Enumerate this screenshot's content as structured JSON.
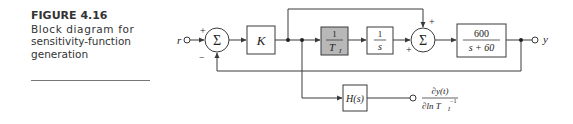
{
  "figure": {
    "number": "FIGURE 4.16",
    "caption_lines": [
      "Block diagram for",
      "sensitivity-function",
      "generation"
    ]
  },
  "diagram": {
    "input_label": "r",
    "output_label": "y",
    "sum1": {
      "symbol": "Σ",
      "sign_top": "+",
      "sign_bottom": "−"
    },
    "sum2": {
      "symbol": "Σ",
      "sign_top": "+",
      "sign_left": "+"
    },
    "blocks": {
      "gain": "K",
      "inv_ti": {
        "num": "1",
        "den": "T",
        "den_sub": "I"
      },
      "integrator": {
        "num": "1",
        "den": "s"
      },
      "plant": {
        "num": "600",
        "den": "s + 60"
      },
      "sensitivity_filter": "H(s)"
    },
    "sensitivity_output": {
      "num": "∂y(t)",
      "den_prefix": "∂ln T",
      "den_sub": "I",
      "den_sup": "−1"
    },
    "colors": {
      "line": "#3a3a3a",
      "highlight_block": "#b8b8b8",
      "block_fill": "#ffffff"
    }
  }
}
